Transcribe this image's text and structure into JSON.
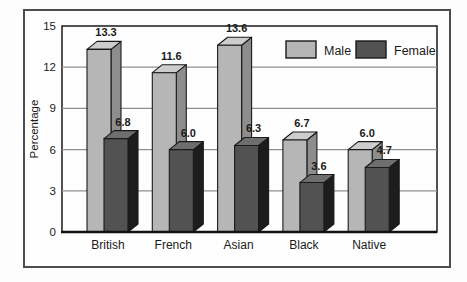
{
  "figure": {
    "frame_border_color": "#4d4d4d",
    "background_color": "#fefefe"
  },
  "chart_data": {
    "type": "bar",
    "projection": "3d",
    "title": "",
    "categories": [
      "British",
      "French",
      "Asian",
      "Black",
      "Native"
    ],
    "series": [
      {
        "name": "Male",
        "values": [
          13.3,
          11.6,
          13.6,
          6.7,
          6.0
        ],
        "front_color": "#b6b6b6",
        "top_color": "#cdcdcd",
        "side_color": "#8d8d8d"
      },
      {
        "name": "Female",
        "values": [
          6.8,
          6.0,
          6.3,
          3.6,
          4.7
        ],
        "front_color": "#525252",
        "top_color": "#6e6e6e",
        "side_color": "#1d1d1d"
      }
    ],
    "value_labels": {
      "Male": [
        "13.3",
        "11.6",
        "13.6",
        "6.7",
        "6.0"
      ],
      "Female": [
        "6.8",
        "6.0",
        "6.3",
        "3.6",
        "4.7"
      ]
    },
    "xlabel": "",
    "ylabel": "Percentage",
    "yticks": [
      "0",
      "3",
      "6",
      "9",
      "12",
      "15"
    ],
    "ylim": [
      0,
      15
    ],
    "grid": true,
    "gridline_color": "#8f8f8f",
    "outline_color": "#1a1a1a",
    "legend_position": "top-right",
    "legend": [
      {
        "label": "Male",
        "swatch_color": "#b6b6b6"
      },
      {
        "label": "Female",
        "swatch_color": "#525252"
      }
    ]
  }
}
